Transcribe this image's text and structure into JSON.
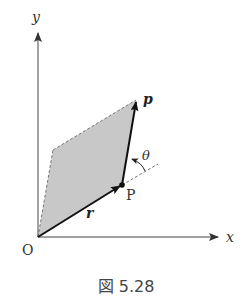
{
  "figure": {
    "caption": "図 5.28",
    "labels": {
      "x_axis": "x",
      "y_axis": "y",
      "origin": "O",
      "point": "P",
      "vector_r": "r",
      "vector_p": "p",
      "angle": "θ"
    },
    "colors": {
      "shading": "#c8c8c8",
      "lines": "#222222",
      "axes": "#444444",
      "dashed": "#777777",
      "text": "#333333"
    },
    "geometry": {
      "origin": [
        38,
        237
      ],
      "point_P": [
        122,
        185
      ],
      "tip_p": [
        136,
        100
      ],
      "fourth_vertex": [
        53,
        150
      ]
    }
  }
}
